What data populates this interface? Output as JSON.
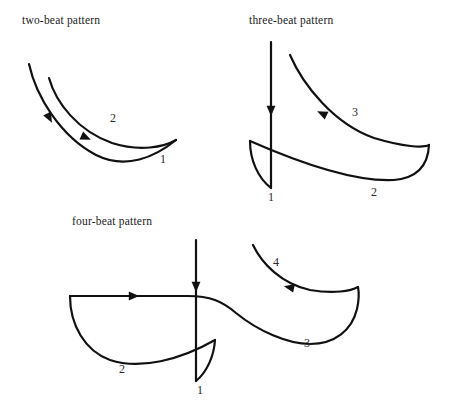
{
  "figure": {
    "name": "conducting-beat-patterns",
    "width": 452,
    "height": 411,
    "background_color": "#ffffff",
    "stroke_color": "#111111",
    "text_color": "#1a1a1a"
  },
  "patterns": [
    {
      "id": "two-beat",
      "title": "two-beat pattern",
      "title_x": 22,
      "title_y": 24,
      "beat_count": 2,
      "labels": [
        {
          "text": "2",
          "x": 110,
          "y": 122
        },
        {
          "text": "1",
          "x": 160,
          "y": 163
        }
      ],
      "strokes": [
        {
          "name": "two-beat-downstroke-1",
          "d": "M 29 64 C 36 96 60 136 96 155 C 126 170 155 157 176 140",
          "width": 2.2
        },
        {
          "name": "two-beat-downstroke-2",
          "d": "M 49 78 C 56 103 78 131 112 143 C 140 152 164 147 176 140",
          "width": 2.2
        }
      ],
      "arrows": [
        {
          "name": "two-beat-arrow-1",
          "x": 50,
          "y": 119,
          "angle": 62,
          "size": 10
        },
        {
          "name": "two-beat-arrow-2",
          "x": 87,
          "y": 138,
          "angle": 24,
          "size": 10
        }
      ]
    },
    {
      "id": "three-beat",
      "title": "three-beat pattern",
      "title_x": 249,
      "title_y": 24,
      "beat_count": 3,
      "labels": [
        {
          "text": "3",
          "x": 352,
          "y": 116
        },
        {
          "text": "2",
          "x": 371,
          "y": 196
        },
        {
          "text": "1",
          "x": 268,
          "y": 201
        }
      ],
      "strokes": [
        {
          "name": "three-beat-vertical-downstroke",
          "d": "M 271 42 L 271 188",
          "width": 2.2
        },
        {
          "name": "three-beat-left-hook",
          "d": "M 250 141 C 250 160 258 178 271 188",
          "width": 2.2
        },
        {
          "name": "three-beat-lower-bowl",
          "d": "M 250 141 C 300 163 355 182 394 180 C 417 178 428 166 429 145",
          "width": 2.2
        },
        {
          "name": "three-beat-upper-return",
          "d": "M 290 55 C 303 85 334 124 374 138 C 404 147 423 148 429 145",
          "width": 2.2
        }
      ],
      "arrows": [
        {
          "name": "three-beat-arrow-1",
          "x": 271,
          "y": 112,
          "angle": 90,
          "size": 10
        },
        {
          "name": "three-beat-arrow-3",
          "x": 321,
          "y": 113,
          "angle": 205,
          "size": 10
        }
      ]
    },
    {
      "id": "four-beat",
      "title": "four-beat pattern",
      "title_x": 72,
      "title_y": 225,
      "beat_count": 4,
      "labels": [
        {
          "text": "4",
          "x": 273,
          "y": 266
        },
        {
          "text": "3",
          "x": 304,
          "y": 347
        },
        {
          "text": "2",
          "x": 119,
          "y": 373
        },
        {
          "text": "1",
          "x": 197,
          "y": 394
        }
      ],
      "strokes": [
        {
          "name": "four-beat-vertical-downstroke",
          "d": "M 196 240 L 196 381",
          "width": 2.2
        },
        {
          "name": "four-beat-left-bowl",
          "d": "M 70 296 C 70 325 85 351 110 360 C 140 370 180 360 215 340",
          "width": 2.2
        },
        {
          "name": "four-beat-horizontal-top",
          "d": "M 70 296 L 188 296 C 210 296 222 301 236 313 C 258 331 288 344 310 344",
          "width": 2.2
        },
        {
          "name": "four-beat-center-hook",
          "d": "M 215 340 C 214 356 207 372 196 381",
          "width": 2.2
        },
        {
          "name": "four-beat-right-bowl",
          "d": "M 310 344 C 335 344 352 330 357 309 C 359 300 359 292 358 287",
          "width": 2.2
        },
        {
          "name": "four-beat-right-return",
          "d": "M 253 245 C 262 264 282 284 310 290 C 334 294 351 291 358 287",
          "width": 2.2
        }
      ],
      "arrows": [
        {
          "name": "four-beat-arrow-1",
          "x": 196,
          "y": 288,
          "angle": 90,
          "size": 10
        },
        {
          "name": "four-beat-arrow-2",
          "x": 135,
          "y": 296,
          "angle": 0,
          "size": 10
        },
        {
          "name": "four-beat-arrow-4",
          "x": 288,
          "y": 287,
          "angle": 192,
          "size": 10
        }
      ]
    }
  ]
}
